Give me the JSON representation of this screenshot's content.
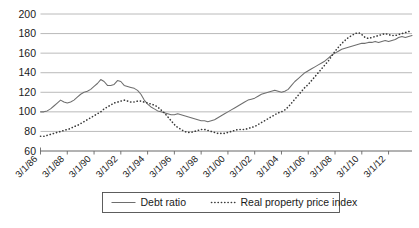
{
  "chart_data": {
    "type": "line",
    "title": "",
    "xlabel": "",
    "ylabel": "",
    "ylim": [
      60,
      200
    ],
    "y_ticks": [
      60,
      80,
      100,
      120,
      140,
      160,
      180,
      200
    ],
    "grid": true,
    "legend_position": "bottom",
    "x_tick_labels": [
      "3/1/86",
      "3/1/88",
      "3/1/90",
      "3/1/92",
      "3/1/94",
      "3/1/96",
      "3/1/98",
      "3/1/00",
      "3/1/02",
      "3/1/04",
      "3/1/06",
      "3/1/08",
      "3/1/10",
      "3/1/12"
    ],
    "x_start": "3/1/86",
    "x_end": "3/1/13",
    "x_interval": "quarterly",
    "series": [
      {
        "name": "Debt ratio",
        "style": "solid",
        "color": "#6e6e6e",
        "values": [
          100,
          100,
          101,
          103,
          106,
          109,
          112,
          110,
          109,
          110,
          112,
          115,
          118,
          120,
          121,
          123,
          126,
          129,
          133,
          131,
          127,
          127,
          128,
          132,
          131,
          127,
          126,
          125,
          124,
          122,
          118,
          112,
          108,
          105,
          103,
          101,
          100,
          99,
          98,
          97,
          97,
          98,
          97,
          96,
          95,
          94,
          93,
          92,
          91,
          91,
          90,
          91,
          92,
          94,
          96,
          98,
          100,
          102,
          104,
          106,
          108,
          110,
          112,
          113,
          114,
          116,
          118,
          119,
          120,
          121,
          122,
          121,
          120,
          121,
          123,
          127,
          131,
          134,
          137,
          140,
          142,
          144,
          146,
          148,
          150,
          152,
          155,
          158,
          160,
          162,
          164,
          165,
          166,
          167,
          168,
          169,
          170,
          170,
          171,
          171,
          172,
          171,
          172,
          173,
          172,
          173,
          174,
          176,
          177,
          176,
          177,
          178
        ]
      },
      {
        "name": "Real property price index",
        "style": "dotted",
        "color": "#3a3a3a",
        "values": [
          75,
          75,
          76,
          77,
          78,
          79,
          80,
          81,
          82,
          83,
          85,
          86,
          88,
          90,
          92,
          94,
          96,
          98,
          100,
          103,
          105,
          107,
          109,
          110,
          111,
          112,
          111,
          110,
          110,
          111,
          111,
          110,
          109,
          108,
          107,
          105,
          102,
          99,
          95,
          91,
          87,
          84,
          82,
          80,
          79,
          79,
          80,
          81,
          82,
          82,
          81,
          80,
          79,
          78,
          78,
          78,
          79,
          80,
          81,
          82,
          82,
          82,
          83,
          84,
          85,
          87,
          89,
          91,
          93,
          95,
          97,
          99,
          100,
          102,
          105,
          109,
          113,
          117,
          121,
          125,
          128,
          132,
          136,
          140,
          144,
          148,
          152,
          157,
          162,
          166,
          170,
          173,
          176,
          178,
          180,
          181,
          179,
          176,
          175,
          176,
          177,
          178,
          179,
          180,
          179,
          178,
          178,
          179,
          180,
          181,
          182,
          183
        ]
      }
    ]
  },
  "legend": {
    "items": [
      {
        "label": "Debt ratio",
        "style": "solid"
      },
      {
        "label": "Real property price index",
        "style": "dotted"
      }
    ]
  }
}
